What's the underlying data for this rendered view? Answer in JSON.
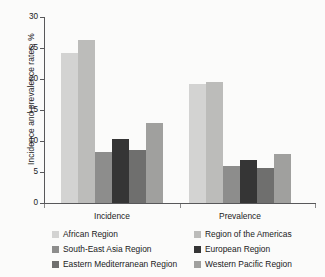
{
  "chart_data": {
    "type": "bar",
    "title": "",
    "xlabel": "",
    "ylabel": "Incidence and prevalence rates, %",
    "ylim": [
      0,
      30
    ],
    "yticks": [
      0,
      5,
      10,
      15,
      20,
      25,
      30
    ],
    "ytick_labels": [
      "0",
      "5",
      "10",
      "15",
      "20",
      "25",
      "30"
    ],
    "grid": false,
    "legend_position": "bottom",
    "categories": [
      "Incidence",
      "Prevalence"
    ],
    "series": [
      {
        "name": "African Region",
        "color": "#d3d3d2",
        "values": [
          24.2,
          19.2
        ]
      },
      {
        "name": "Region of the Americas",
        "color": "#bcbcba",
        "values": [
          26.3,
          19.5
        ]
      },
      {
        "name": "South-East Asia Region",
        "color": "#8d8d8c",
        "values": [
          8.2,
          5.9
        ]
      },
      {
        "name": "European Region",
        "color": "#353535",
        "values": [
          10.3,
          6.9
        ]
      },
      {
        "name": "Eastern Mediterranean Region",
        "color": "#6f6f6e",
        "values": [
          8.6,
          5.6
        ]
      },
      {
        "name": "Western Pacific Region",
        "color": "#a0a09e",
        "values": [
          12.9,
          7.9
        ]
      }
    ]
  },
  "axis": {
    "y_title": "Incidence and prevalence rates, %",
    "y_tick_0": "0",
    "y_tick_1": "5",
    "y_tick_2": "10",
    "y_tick_3": "15",
    "y_tick_4": "20",
    "y_tick_5": "25",
    "y_tick_6": "30"
  },
  "categories": {
    "incidence": "Incidence",
    "prevalence": "Prevalence"
  },
  "legend": {
    "items": [
      {
        "label": "African Region",
        "color": "#d3d3d2"
      },
      {
        "label": "Region of the Americas",
        "color": "#bcbcba"
      },
      {
        "label": "South-East Asia Region",
        "color": "#8d8d8c"
      },
      {
        "label": "European Region",
        "color": "#353535"
      },
      {
        "label": "Eastern Mediterranean Region",
        "color": "#6f6f6e"
      },
      {
        "label": "Western Pacific Region",
        "color": "#a0a09e"
      }
    ]
  }
}
